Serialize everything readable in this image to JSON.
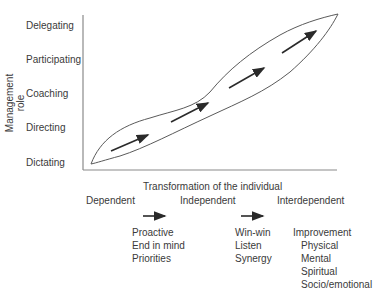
{
  "y_axis": {
    "title": "Management role",
    "labels": [
      "Delegating",
      "Participating",
      "Coaching",
      "Directing",
      "Dictating"
    ]
  },
  "x_axis": {
    "title": "Transformation of the individual"
  },
  "stages": [
    "Dependent",
    "Independent",
    "Interdependent"
  ],
  "stage_details": {
    "independent_items": [
      "Proactive",
      "End in mind",
      "Priorities"
    ],
    "interdependent_items": [
      "Win-win",
      "Listen",
      "Synergy"
    ],
    "improvement": {
      "title": "Improvement",
      "items": [
        "Physical",
        "Mental",
        "Spiritual",
        "Socio/emotional"
      ]
    }
  },
  "colors": {
    "line": "#5a5a5a",
    "arrow": "#2a2a2a",
    "axis": "#8a8a8a"
  }
}
